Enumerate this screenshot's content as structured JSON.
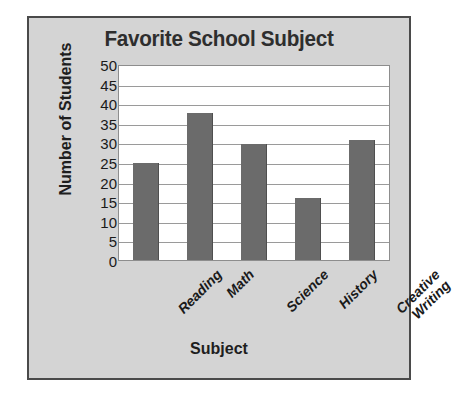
{
  "chart_data": {
    "type": "bar",
    "title": "Favorite School Subject",
    "xlabel": "Subject",
    "ylabel": "Number of Students",
    "categories": [
      "Reading",
      "Math",
      "Science",
      "History",
      "Creative Writing"
    ],
    "values": [
      25,
      38,
      30,
      16,
      31
    ],
    "ylim": [
      0,
      50
    ],
    "ytick_step": 5,
    "yticks": [
      50,
      45,
      40,
      35,
      30,
      25,
      20,
      15,
      10,
      5,
      0
    ],
    "grid": "horizontal",
    "legend": null,
    "colors": {
      "bar": "#6b6b6b",
      "bar_edge": "#4f4f4f",
      "plot_background": "#ffffff",
      "panel_background": "#d4d4d4",
      "panel_border": "#4a4a4a",
      "gridline": "#9a9a9a",
      "title_text": "#2e2e2e",
      "axis_text": "#1a1a1a"
    }
  }
}
